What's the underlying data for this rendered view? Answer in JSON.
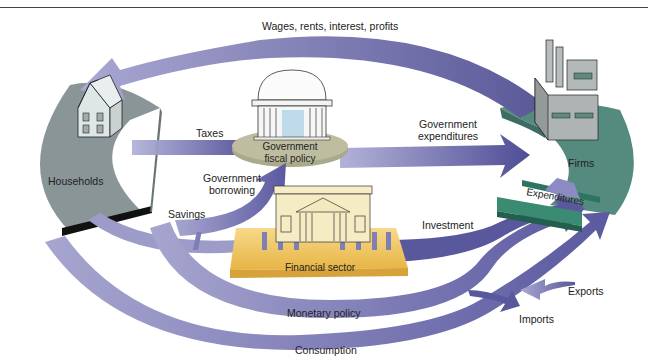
{
  "diagram": {
    "nodes": {
      "households": {
        "label": "Households"
      },
      "firms": {
        "label": "Firms"
      },
      "government": {
        "label_line1": "Government",
        "label_line2": "fiscal policy"
      },
      "financial": {
        "label": "Financial sector"
      },
      "expenditures": {
        "label": "Expenditures"
      }
    },
    "flows": {
      "wages": "Wages, rents, interest, profits",
      "taxes": "Taxes",
      "gov_exp_line1": "Government",
      "gov_exp_line2": "expenditures",
      "gov_borrow_line1": "Government",
      "gov_borrow_line2": "borrowing",
      "savings": "Savings",
      "investment": "Investment",
      "monetary": "Monetary policy",
      "consumption": "Consumption",
      "exports": "Exports",
      "imports": "Imports"
    },
    "colors": {
      "arrow": "#8a88c0",
      "arrow_dark": "#4e4c94",
      "households_base": "#7f8c8f",
      "firms_base": "#4f8478",
      "expend_bar": "#2f7a62",
      "government_ellipse": "#b9b89a",
      "financial_base": "#efc35a"
    }
  }
}
